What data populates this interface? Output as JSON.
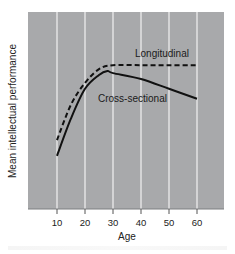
{
  "chart_data": {
    "type": "line",
    "title": "",
    "xlabel": "Age",
    "ylabel": "Mean intellectual performance",
    "x_ticks": [
      10,
      20,
      30,
      40,
      50,
      60
    ],
    "xlim": [
      0,
      70
    ],
    "ylim": [
      0,
      100
    ],
    "y_ticks_shown": false,
    "grid": {
      "vertical": true,
      "horizontal": false
    },
    "background": "#a8a9ab",
    "gridline_color": "#f2f2f2",
    "legend": "inline labels",
    "series": [
      {
        "name": "Longitudinal",
        "style": "dashed",
        "color": "#111111",
        "x": [
          10,
          15,
          20,
          25,
          30,
          40,
          50,
          60
        ],
        "values": [
          35,
          53,
          64,
          71,
          73,
          73,
          73,
          73
        ]
      },
      {
        "name": "Cross-sectional",
        "style": "solid",
        "color": "#111111",
        "x": [
          10,
          15,
          20,
          25,
          28,
          30,
          40,
          50,
          60
        ],
        "values": [
          27,
          46,
          61,
          68,
          70,
          69,
          66,
          61,
          56
        ]
      }
    ],
    "annotations": [
      {
        "text": "Longitudinal",
        "near_x": 40,
        "near_y": 79
      },
      {
        "text": "Cross-sectional",
        "near_x": 35,
        "near_y": 56
      }
    ]
  },
  "labels": {
    "x_axis": "Age",
    "y_axis": "Mean intellectual performance",
    "x_ticks": [
      "10",
      "20",
      "30",
      "40",
      "50",
      "60"
    ],
    "longitudinal": "Longitudinal",
    "cross_sectional": "Cross-sectional"
  }
}
